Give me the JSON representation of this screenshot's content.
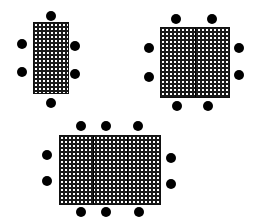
{
  "diagram": {
    "type": "seating-layouts",
    "colors": {
      "table_fill": "#1a1a1a",
      "table_pattern": "#ffffff",
      "chair": "#000000",
      "background": "#ffffff"
    },
    "layouts": [
      {
        "name": "small-table-6-seats",
        "table": {
          "x": 33,
          "y": 22,
          "w": 36,
          "h": 72,
          "sections": 1
        },
        "chairs": [
          {
            "x": 51,
            "y": 16
          },
          {
            "x": 22,
            "y": 44
          },
          {
            "x": 22,
            "y": 72
          },
          {
            "x": 75,
            "y": 46
          },
          {
            "x": 75,
            "y": 74
          },
          {
            "x": 51,
            "y": 103
          }
        ]
      },
      {
        "name": "square-table-8-seats",
        "table": {
          "x": 160,
          "y": 27,
          "w": 70,
          "h": 71,
          "sections": 2
        },
        "chairs": [
          {
            "x": 176,
            "y": 19
          },
          {
            "x": 212,
            "y": 19
          },
          {
            "x": 149,
            "y": 48
          },
          {
            "x": 149,
            "y": 77
          },
          {
            "x": 239,
            "y": 48
          },
          {
            "x": 239,
            "y": 75
          },
          {
            "x": 177,
            "y": 106
          },
          {
            "x": 208,
            "y": 106
          }
        ]
      },
      {
        "name": "large-table-10-seats",
        "table": {
          "x": 59,
          "y": 135,
          "w": 102,
          "h": 70,
          "sections": 3
        },
        "chairs": [
          {
            "x": 81,
            "y": 126
          },
          {
            "x": 106,
            "y": 126
          },
          {
            "x": 138,
            "y": 126
          },
          {
            "x": 47,
            "y": 155
          },
          {
            "x": 47,
            "y": 181
          },
          {
            "x": 171,
            "y": 158
          },
          {
            "x": 171,
            "y": 184
          },
          {
            "x": 81,
            "y": 212
          },
          {
            "x": 106,
            "y": 212
          },
          {
            "x": 139,
            "y": 212
          }
        ]
      }
    ]
  }
}
